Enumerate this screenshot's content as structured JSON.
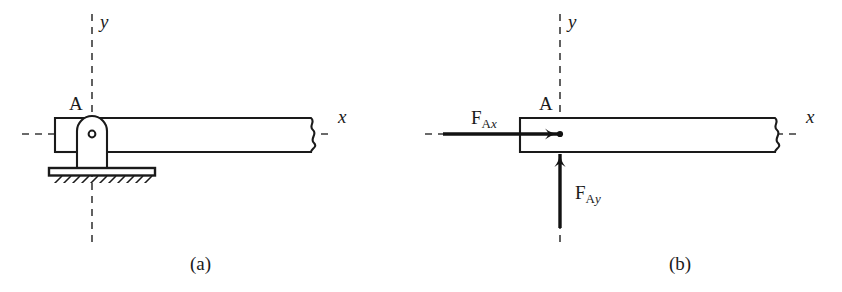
{
  "figure": {
    "stroke_color": "#1a1a1a",
    "dash_color": "#3a3a3a",
    "fill_color": "#ffffff"
  },
  "panel_a": {
    "caption": "(a)",
    "point_label": "A",
    "x_axis_label": "x",
    "y_axis_label": "y",
    "elements": {
      "beam": "beam-outline",
      "support": "pin-support",
      "base_plate": "support-base-plate",
      "ground": "ground-hatching",
      "pin": "pin-hole",
      "break": "beam-break-symbol"
    }
  },
  "panel_b": {
    "caption": "(b)",
    "point_label": "A",
    "x_axis_label": "x",
    "y_axis_label": "y",
    "force_x": {
      "symbol": "F",
      "sub_point": "A",
      "sub_axis": "x"
    },
    "force_y": {
      "symbol": "F",
      "sub_point": "A",
      "sub_axis": "y"
    },
    "elements": {
      "beam": "beam-outline",
      "arrow_x": "force-arrow-horizontal",
      "arrow_y": "force-arrow-vertical",
      "origin": "origin-dot",
      "break": "beam-break-symbol"
    }
  }
}
